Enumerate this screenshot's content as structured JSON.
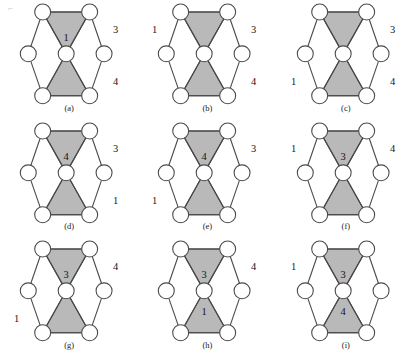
{
  "figure": {
    "type": "diagram",
    "columns": 3,
    "rows": 3,
    "colors": {
      "triangle_fill": "#b9b9b9",
      "stroke": "#4a4a4a",
      "node_fill": "#ffffff",
      "text": "#141414",
      "background": "#ffffff"
    },
    "artifact_mark": "⌐"
  },
  "geometry": {
    "node_radius": 8.0,
    "hex_center_x": 66,
    "hex_center_y": 54,
    "hex_rx": 38,
    "hex_ry": 42,
    "note": "outer vertices at top-left, top-right, right, bottom-right, bottom-left, left; center vertex at middle"
  },
  "panels": [
    {
      "id": "a",
      "caption": "(a)",
      "inner_labels": [
        {
          "slot": "top-triangle",
          "text": "1"
        }
      ],
      "outer_labels": [
        {
          "slot": "right-upper",
          "text": "3"
        },
        {
          "slot": "right-lower",
          "text": "4"
        }
      ]
    },
    {
      "id": "b",
      "caption": "(b)",
      "inner_labels": [],
      "outer_labels": [
        {
          "slot": "left-upper",
          "text": "1"
        },
        {
          "slot": "right-upper",
          "text": "3"
        },
        {
          "slot": "right-lower",
          "text": "4"
        }
      ]
    },
    {
      "id": "c",
      "caption": "(c)",
      "inner_labels": [],
      "outer_labels": [
        {
          "slot": "right-upper",
          "text": "3"
        },
        {
          "slot": "left-lower",
          "text": "1"
        },
        {
          "slot": "right-lower",
          "text": "4"
        }
      ]
    },
    {
      "id": "d",
      "caption": "(d)",
      "inner_labels": [
        {
          "slot": "top-triangle",
          "text": "4"
        }
      ],
      "outer_labels": [
        {
          "slot": "right-upper",
          "text": "3"
        },
        {
          "slot": "right-lower",
          "text": "1"
        }
      ]
    },
    {
      "id": "e",
      "caption": "(e)",
      "inner_labels": [
        {
          "slot": "top-triangle",
          "text": "4"
        }
      ],
      "outer_labels": [
        {
          "slot": "right-upper",
          "text": "3"
        },
        {
          "slot": "left-lower",
          "text": "1"
        }
      ]
    },
    {
      "id": "f",
      "caption": "(f)",
      "inner_labels": [
        {
          "slot": "top-triangle",
          "text": "3"
        }
      ],
      "outer_labels": [
        {
          "slot": "left-upper",
          "text": "1"
        },
        {
          "slot": "right-upper",
          "text": "4"
        }
      ]
    },
    {
      "id": "g",
      "caption": "(g)",
      "inner_labels": [
        {
          "slot": "top-triangle",
          "text": "3"
        }
      ],
      "outer_labels": [
        {
          "slot": "right-upper",
          "text": "4"
        },
        {
          "slot": "left-lower",
          "text": "1"
        }
      ]
    },
    {
      "id": "h",
      "caption": "(h)",
      "inner_labels": [
        {
          "slot": "top-triangle",
          "text": "3"
        },
        {
          "slot": "bottom-triangle",
          "text": "1"
        }
      ],
      "outer_labels": [
        {
          "slot": "right-upper",
          "text": "4"
        }
      ]
    },
    {
      "id": "i",
      "caption": "(i)",
      "inner_labels": [
        {
          "slot": "top-triangle",
          "text": "3"
        },
        {
          "slot": "bottom-triangle",
          "text": "4"
        }
      ],
      "outer_labels": [
        {
          "slot": "left-upper",
          "text": "1"
        }
      ]
    }
  ]
}
